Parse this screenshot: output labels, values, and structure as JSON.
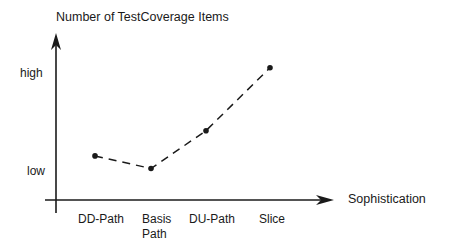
{
  "chart_data": {
    "type": "line",
    "title": "",
    "ylabel": "Number of TestCoverage Items",
    "xlabel": "Sophistication",
    "y_ticks": [
      "low",
      "high"
    ],
    "categories": [
      "DD-Path",
      "Basis Path",
      "DU-Path",
      "Slice"
    ],
    "series": [
      {
        "name": "Number of TestCoverage Items",
        "line_style": "dashed",
        "values": [
          0.35,
          0.25,
          0.55,
          1.05
        ]
      }
    ],
    "ylim": [
      0,
      1.3
    ],
    "grid": false,
    "legend": "none"
  },
  "labels": {
    "ylabel": "Number of TestCoverage Items",
    "xlabel": "Sophistication",
    "y_high": "high",
    "y_low": "low",
    "x_cat_0": "DD-Path",
    "x_cat_1_line1": "Basis",
    "x_cat_1_line2": "Path",
    "x_cat_2": "DU-Path",
    "x_cat_3": "Slice"
  },
  "colors": {
    "ink": "#1a1a1a",
    "background": "#ffffff"
  }
}
